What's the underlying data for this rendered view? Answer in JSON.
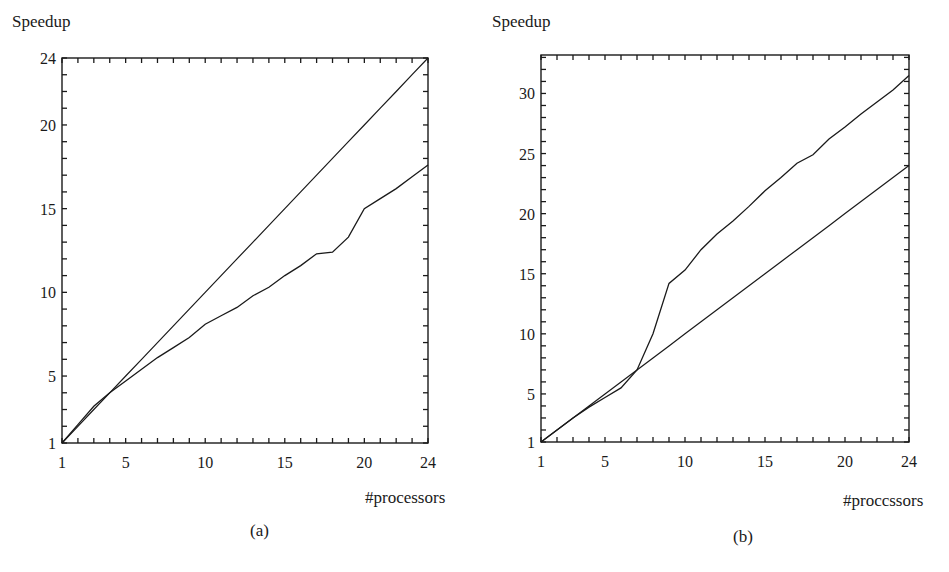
{
  "chart_data": [
    {
      "panel_label": "(a)",
      "type": "line",
      "title": "",
      "xlabel": "#processors",
      "ylabel": "Speedup",
      "xlim": [
        1,
        24
      ],
      "ylim": [
        1,
        24
      ],
      "x_ticks": [
        1,
        5,
        10,
        15,
        20,
        24
      ],
      "y_ticks": [
        1,
        5,
        10,
        15,
        20,
        24
      ],
      "grid": false,
      "legend": null,
      "x": [
        1,
        2,
        3,
        4,
        5,
        6,
        7,
        8,
        9,
        10,
        11,
        12,
        13,
        14,
        15,
        16,
        17,
        18,
        19,
        20,
        21,
        22,
        23,
        24
      ],
      "series": [
        {
          "name": "linear speedup",
          "values": [
            1,
            2,
            3,
            4,
            5,
            6,
            7,
            8,
            9,
            10,
            11,
            12,
            13,
            14,
            15,
            16,
            17,
            18,
            19,
            20,
            21,
            22,
            23,
            24
          ]
        },
        {
          "name": "measured speedup",
          "values": [
            1,
            2.1,
            3.2,
            4.0,
            4.7,
            5.4,
            6.1,
            6.7,
            7.3,
            8.1,
            8.6,
            9.1,
            9.8,
            10.3,
            11.0,
            11.6,
            12.3,
            12.4,
            13.3,
            15.0,
            15.6,
            16.2,
            16.9,
            17.6
          ]
        }
      ]
    },
    {
      "panel_label": "(b)",
      "type": "line",
      "title": "",
      "xlabel": "#proccssors",
      "ylabel": "Speedup",
      "xlim": [
        1,
        24
      ],
      "ylim": [
        1,
        33.2
      ],
      "x_ticks": [
        1,
        5,
        10,
        15,
        20,
        24
      ],
      "y_ticks": [
        1,
        5,
        10,
        15,
        20,
        25,
        30
      ],
      "grid": false,
      "legend": null,
      "x": [
        1,
        2,
        3,
        4,
        5,
        6,
        7,
        8,
        9,
        10,
        11,
        12,
        13,
        14,
        15,
        16,
        17,
        18,
        19,
        20,
        21,
        22,
        23,
        24
      ],
      "series": [
        {
          "name": "linear speedup",
          "values": [
            1,
            2,
            3,
            4,
            5,
            6,
            7,
            8,
            9,
            10,
            11,
            12,
            13,
            14,
            15,
            16,
            17,
            18,
            19,
            20,
            21,
            22,
            23,
            24
          ]
        },
        {
          "name": "measured speedup",
          "values": [
            1,
            2.0,
            3.0,
            3.9,
            4.7,
            5.5,
            7.0,
            10.0,
            14.2,
            15.3,
            17.0,
            18.3,
            19.4,
            20.6,
            21.9,
            23.0,
            24.2,
            24.9,
            26.2,
            27.2,
            28.3,
            29.3,
            30.3,
            31.5
          ]
        }
      ]
    }
  ],
  "panels": [
    {
      "ylabel": "Speedup",
      "xlabel": "#processors",
      "caption": "(a)"
    },
    {
      "ylabel": "Speedup",
      "xlabel": "#proccssors",
      "caption": "(b)"
    }
  ],
  "style": {
    "ink": "#1a1a1a",
    "background": "#ffffff"
  }
}
